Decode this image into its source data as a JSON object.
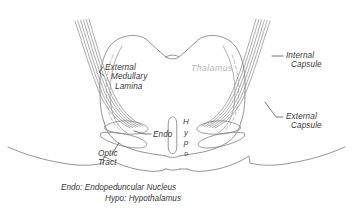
{
  "figure": {
    "kind": "coronal-brain-section-diagram",
    "background_color": "#ffffff",
    "ink_color": "#6e6e6e",
    "text_color": "#3a3a3a",
    "faint_text_color": "#b8b8b8"
  },
  "labels": {
    "external_medullary_lamina": {
      "line1": "External",
      "line2": "Medullary",
      "line3": "Lamina"
    },
    "thalamus": "Thalamus",
    "internal_capsule": {
      "line1": "Internal",
      "line2": "Capsule"
    },
    "external_capsule": {
      "line1": "External",
      "line2": "Capsule"
    },
    "endo": "Endo",
    "optic_tract": {
      "line1": "Optic",
      "line2": "Tract"
    },
    "hypo": {
      "c1": "H",
      "c2": "y",
      "c3": "p",
      "c4": "o"
    }
  },
  "legend": {
    "line1": "Endo: Endopeduncular Nucleus",
    "line2": "Hypo: Hypothalamus"
  }
}
